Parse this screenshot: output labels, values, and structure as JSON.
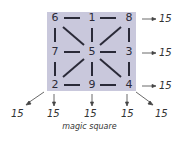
{
  "diagram": {
    "caption": "magic square",
    "grid": [
      [
        "6",
        "1",
        "8"
      ],
      [
        "7",
        "5",
        "3"
      ],
      [
        "2",
        "9",
        "4"
      ]
    ],
    "row_sums": [
      "15",
      "15",
      "15"
    ],
    "diagonal_sum_left": "15",
    "column_sums": [
      "15",
      "15",
      "15"
    ],
    "diagonal_sum_right": "15",
    "colors": {
      "square_fill": "#c9c8dc",
      "lines": "#2a2a38",
      "text": "#333333"
    }
  }
}
